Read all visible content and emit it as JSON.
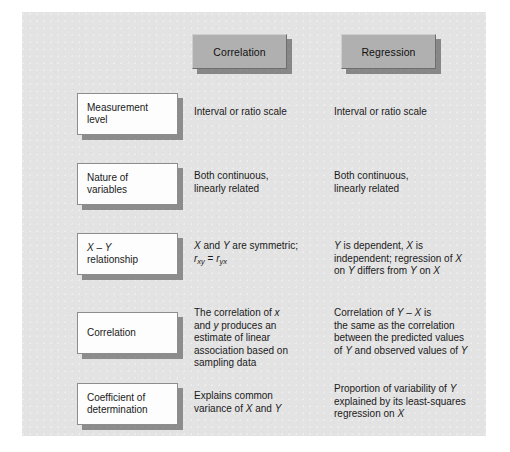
{
  "figure": {
    "type": "comparison-table",
    "headers": [
      {
        "id": "correlation",
        "label": "Correlation"
      },
      {
        "id": "regression",
        "label": "Regression"
      }
    ],
    "rows": [
      {
        "id": "measurement-level",
        "label_line1": "Measurement",
        "label_line2": "level",
        "correlation": "Interval or ratio scale",
        "regression": "Interval or ratio scale"
      },
      {
        "id": "nature-of-variables",
        "label_line1": "Nature of",
        "label_line2": "variables",
        "correlation": "Both continuous, linearly related",
        "regression": "Both continuous, linearly related"
      },
      {
        "id": "x-y-relationship",
        "label_line1": "X – Y",
        "label_line2": "relationship",
        "correlation": "X and Y are symmetric; rxy = ryx",
        "regression": "Y is dependent, X is independent; regression of X on Y differs from Y on X"
      },
      {
        "id": "correlation",
        "label_line1": "Correlation",
        "label_line2": "",
        "correlation": "The correlation of x and y produces an estimate of linear association based on sampling data",
        "regression": "Correlation of Y – X is the same as the correlation between the predicted values of Y and observed values of Y"
      },
      {
        "id": "coefficient-of-determination",
        "label_line1": "Coefficient of",
        "label_line2": "determination",
        "correlation": "Explains common variance of X and Y",
        "regression": "Proportion of variability of Y explained by its least-squares regression on X"
      }
    ],
    "colors": {
      "panel_background": "#e3e3e3",
      "header_box_fill": "#b0b0b0",
      "label_box_fill": "#fdfdfd",
      "text": "#1a1a1a",
      "shadow": "#4a4a4a"
    }
  }
}
